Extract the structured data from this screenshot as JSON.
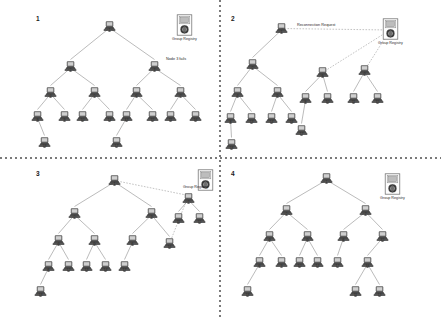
{
  "figure": {
    "background": "#ffffff",
    "edge_color": "#8d8d8d",
    "text_color": "#2b2b2b",
    "node_icon": "computer-icon",
    "registry_icon": "group-registry-icon"
  },
  "labels": {
    "registry": "Group Registry",
    "node_fails": "Node 3 fails",
    "reconnection_request": "Reconnection Request"
  },
  "panels": [
    {
      "number": "1",
      "caption": "Node 3 fails",
      "registry": "Group Registry",
      "annotations": [
        "Node 3 fails"
      ],
      "nodes": [
        {
          "id": "1",
          "x": 103,
          "y": 18
        },
        {
          "id": "2",
          "x": 64,
          "y": 58
        },
        {
          "id": "3",
          "x": 148,
          "y": 58
        },
        {
          "id": "4",
          "x": 44,
          "y": 84
        },
        {
          "id": "5",
          "x": 88,
          "y": 84
        },
        {
          "id": "6",
          "x": 130,
          "y": 84
        },
        {
          "id": "7",
          "x": 174,
          "y": 84
        },
        {
          "id": "8",
          "x": 31,
          "y": 108
        },
        {
          "id": "9",
          "x": 58,
          "y": 108
        },
        {
          "id": "10",
          "x": 76,
          "y": 108
        },
        {
          "id": "14",
          "x": 103,
          "y": 108
        },
        {
          "id": "13",
          "x": 120,
          "y": 108
        },
        {
          "id": "15",
          "x": 146,
          "y": 108
        },
        {
          "id": "11",
          "x": 164,
          "y": 108
        },
        {
          "id": "16",
          "x": 189,
          "y": 108
        },
        {
          "id": "18",
          "x": 38,
          "y": 134
        },
        {
          "id": "17",
          "x": 110,
          "y": 134
        }
      ],
      "edges": [
        [
          "1",
          "2"
        ],
        [
          "1",
          "3"
        ],
        [
          "2",
          "4"
        ],
        [
          "2",
          "5"
        ],
        [
          "3",
          "6"
        ],
        [
          "3",
          "7"
        ],
        [
          "4",
          "8"
        ],
        [
          "4",
          "9"
        ],
        [
          "5",
          "10"
        ],
        [
          "5",
          "14"
        ],
        [
          "6",
          "13"
        ],
        [
          "6",
          "15"
        ],
        [
          "7",
          "11"
        ],
        [
          "7",
          "16"
        ],
        [
          "8",
          "18"
        ],
        [
          "13",
          "17"
        ]
      ],
      "dashed_edges": []
    },
    {
      "number": "2",
      "caption": "Reconnection Request sent to Group Registry",
      "registry": "Group Registry",
      "annotations": [
        "Reconnection Request"
      ],
      "nodes": [
        {
          "id": "1",
          "x": 54,
          "y": 20
        },
        {
          "id": "2",
          "x": 25,
          "y": 56
        },
        {
          "id": "6",
          "x": 95,
          "y": 64
        },
        {
          "id": "7",
          "x": 137,
          "y": 62
        },
        {
          "id": "4",
          "x": 10,
          "y": 84
        },
        {
          "id": "5",
          "x": 50,
          "y": 84
        },
        {
          "id": "9",
          "x": 78,
          "y": 90
        },
        {
          "id": "10",
          "x": 100,
          "y": 90
        },
        {
          "id": "11",
          "x": 126,
          "y": 90
        },
        {
          "id": "15",
          "x": 150,
          "y": 90
        },
        {
          "id": "8",
          "x": 3,
          "y": 110
        },
        {
          "id": "13",
          "x": 24,
          "y": 110
        },
        {
          "id": "14",
          "x": 44,
          "y": 110
        },
        {
          "id": "16",
          "x": 64,
          "y": 110
        },
        {
          "id": "17",
          "x": 74,
          "y": 122
        },
        {
          "id": "18",
          "x": 4,
          "y": 136
        }
      ],
      "edges": [
        [
          "1",
          "2"
        ],
        [
          "2",
          "4"
        ],
        [
          "2",
          "5"
        ],
        [
          "4",
          "8"
        ],
        [
          "4",
          "13"
        ],
        [
          "5",
          "14"
        ],
        [
          "5",
          "16"
        ],
        [
          "6",
          "9"
        ],
        [
          "6",
          "10"
        ],
        [
          "7",
          "11"
        ],
        [
          "7",
          "15"
        ],
        [
          "9",
          "17"
        ],
        [
          "8",
          "18"
        ]
      ],
      "dashed_edges": [
        [
          "1",
          "registry"
        ],
        [
          "6",
          "registry"
        ],
        [
          "7",
          "registry"
        ]
      ]
    },
    {
      "number": "3",
      "caption": "Reconnection in progress",
      "registry": "Group Registry",
      "annotations": [],
      "nodes": [
        {
          "id": "1",
          "x": 108,
          "y": 172
        },
        {
          "id": "2",
          "x": 68,
          "y": 205
        },
        {
          "id": "3",
          "x": 145,
          "y": 205
        },
        {
          "id": "7",
          "x": 182,
          "y": 190
        },
        {
          "id": "11",
          "x": 172,
          "y": 210
        },
        {
          "id": "15",
          "x": 193,
          "y": 210
        },
        {
          "id": "4",
          "x": 52,
          "y": 232
        },
        {
          "id": "5",
          "x": 88,
          "y": 232
        },
        {
          "id": "6",
          "x": 126,
          "y": 232
        },
        {
          "id": "16",
          "x": 163,
          "y": 235
        },
        {
          "id": "8",
          "x": 42,
          "y": 258
        },
        {
          "id": "12",
          "x": 62,
          "y": 258
        },
        {
          "id": "13",
          "x": 80,
          "y": 258
        },
        {
          "id": "14",
          "x": 99,
          "y": 258
        },
        {
          "id": "17",
          "x": 118,
          "y": 258
        },
        {
          "id": "18",
          "x": 34,
          "y": 283
        }
      ],
      "edges": [
        [
          "1",
          "2"
        ],
        [
          "1",
          "3"
        ],
        [
          "2",
          "4"
        ],
        [
          "2",
          "5"
        ],
        [
          "3",
          "6"
        ],
        [
          "3",
          "16"
        ],
        [
          "4",
          "8"
        ],
        [
          "4",
          "12"
        ],
        [
          "5",
          "13"
        ],
        [
          "5",
          "14"
        ],
        [
          "6",
          "17"
        ],
        [
          "8",
          "18"
        ],
        [
          "7",
          "11"
        ],
        [
          "7",
          "15"
        ]
      ],
      "dashed_edges": [
        [
          "1",
          "7"
        ],
        [
          "16",
          "7"
        ]
      ]
    },
    {
      "number": "4",
      "caption": "Tree restored",
      "registry": "Group Registry",
      "annotations": [],
      "nodes": [
        {
          "id": "1",
          "x": 99,
          "y": 170
        },
        {
          "id": "2",
          "x": 59,
          "y": 202
        },
        {
          "id": "7",
          "x": 138,
          "y": 202
        },
        {
          "id": "4",
          "x": 42,
          "y": 228
        },
        {
          "id": "5",
          "x": 80,
          "y": 228
        },
        {
          "id": "6",
          "x": 116,
          "y": 228
        },
        {
          "id": "15",
          "x": 155,
          "y": 228
        },
        {
          "id": "8",
          "x": 32,
          "y": 254
        },
        {
          "id": "9",
          "x": 54,
          "y": 254
        },
        {
          "id": "10",
          "x": 72,
          "y": 254
        },
        {
          "id": "14",
          "x": 90,
          "y": 254
        },
        {
          "id": "17",
          "x": 110,
          "y": 254
        },
        {
          "id": "16",
          "x": 140,
          "y": 254
        },
        {
          "id": "18",
          "x": 20,
          "y": 283
        },
        {
          "id": "11",
          "x": 128,
          "y": 283
        },
        {
          "id": "13",
          "x": 152,
          "y": 283
        }
      ],
      "edges": [
        [
          "1",
          "2"
        ],
        [
          "1",
          "7"
        ],
        [
          "2",
          "4"
        ],
        [
          "2",
          "5"
        ],
        [
          "7",
          "6"
        ],
        [
          "7",
          "15"
        ],
        [
          "4",
          "8"
        ],
        [
          "4",
          "9"
        ],
        [
          "5",
          "10"
        ],
        [
          "5",
          "14"
        ],
        [
          "6",
          "17"
        ],
        [
          "15",
          "16"
        ],
        [
          "8",
          "18"
        ],
        [
          "16",
          "11"
        ],
        [
          "16",
          "13"
        ]
      ],
      "dashed_edges": []
    }
  ]
}
